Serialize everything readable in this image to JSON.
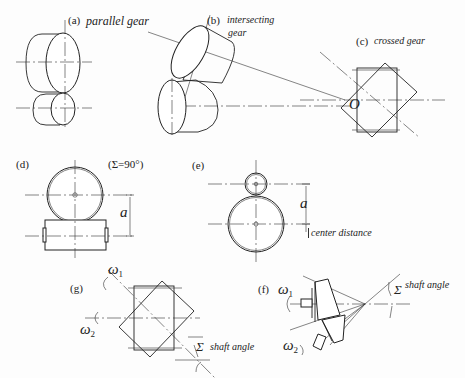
{
  "figure": {
    "panels": [
      {
        "id": "a",
        "tag": "(a)",
        "caption": "parallel gear"
      },
      {
        "id": "b",
        "tag": "(b)",
        "caption_line1": "intersecting",
        "caption_line2": "gear",
        "apex_label": "O"
      },
      {
        "id": "c",
        "tag": "(c)",
        "caption": "crossed gear"
      },
      {
        "id": "d",
        "tag": "(d)",
        "note": "(Σ=90°)",
        "dimension": "a"
      },
      {
        "id": "e",
        "tag": "(e)",
        "dimension": "a",
        "dimension_caption": "center distance"
      },
      {
        "id": "g",
        "tag": "(g)",
        "omega1": "ω",
        "omega1_sub": "1",
        "omega2": "ω",
        "omega2_sub": "2",
        "angle_symbol": "Σ",
        "angle_caption": "shaft angle"
      },
      {
        "id": "f",
        "tag": "(f)",
        "omega1": "ω",
        "omega1_sub": "1",
        "omega2": "ω",
        "omega2_sub": "2",
        "angle_symbol": "Σ",
        "angle_caption": "shaft angle"
      }
    ]
  }
}
